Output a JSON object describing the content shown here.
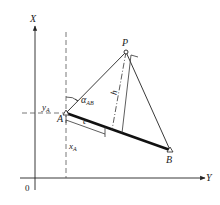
{
  "diagram": {
    "axes": {
      "x_label": "X",
      "y_label": "Y",
      "origin_label": "0"
    },
    "points": {
      "A": {
        "label": "A",
        "x": 66,
        "y": 113
      },
      "B": {
        "label": "B",
        "x": 170,
        "y": 150
      },
      "P": {
        "label": "P",
        "x": 126,
        "y": 52
      }
    },
    "annotations": {
      "yA_main": "y",
      "yA_sub": "A",
      "xA_main": "x",
      "xA_sub": "A",
      "alpha_main": "α",
      "alpha_sub": "AB",
      "e_label": "e",
      "h_label": "h"
    },
    "colors": {
      "line": "#222222",
      "background": "#ffffff"
    }
  }
}
